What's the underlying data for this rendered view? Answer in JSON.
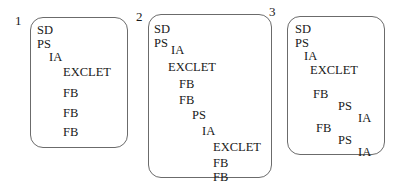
{
  "figure": {
    "type": "sequence-cascade-diagram",
    "panel_count": 3,
    "token_vocabulary": [
      "SD",
      "PS",
      "IA",
      "EXCLET",
      "FB"
    ],
    "background_color": "#ffffff",
    "border_color": "#6b6b6b",
    "text_color": "#191919"
  },
  "panels": [
    {
      "number": "1",
      "number_x": 15,
      "number_y": 14,
      "box": {
        "x": 30,
        "y": 17,
        "w": 98,
        "h": 131
      },
      "tokens": [
        {
          "label": "SD",
          "x": 6,
          "y": 6
        },
        {
          "label": "PS",
          "x": 6,
          "y": 20
        },
        {
          "label": "IA",
          "x": 18,
          "y": 33
        },
        {
          "label": "EXCLET",
          "x": 32,
          "y": 48
        },
        {
          "label": "FB",
          "x": 32,
          "y": 69
        },
        {
          "label": "FB",
          "x": 32,
          "y": 89
        },
        {
          "label": "FB",
          "x": 32,
          "y": 108
        }
      ]
    },
    {
      "number": "2",
      "number_x": 136,
      "number_y": 10,
      "box": {
        "x": 148,
        "y": 14,
        "w": 124,
        "h": 164
      },
      "tokens": [
        {
          "label": "SD",
          "x": 5,
          "y": 8
        },
        {
          "label": "PS",
          "x": 5,
          "y": 22
        },
        {
          "label": "IA",
          "x": 22,
          "y": 29
        },
        {
          "label": "EXCLET",
          "x": 19,
          "y": 46
        },
        {
          "label": "FB",
          "x": 30,
          "y": 63
        },
        {
          "label": "FB",
          "x": 30,
          "y": 79
        },
        {
          "label": "PS",
          "x": 43,
          "y": 94
        },
        {
          "label": "IA",
          "x": 53,
          "y": 110
        },
        {
          "label": "EXCLET",
          "x": 64,
          "y": 126
        },
        {
          "label": "FB",
          "x": 64,
          "y": 142
        },
        {
          "label": "FB",
          "x": 64,
          "y": 156
        }
      ]
    },
    {
      "number": "3",
      "number_x": 269,
      "number_y": 5,
      "box": {
        "x": 287,
        "y": 16,
        "w": 98,
        "h": 139
      },
      "tokens": [
        {
          "label": "SD",
          "x": 7,
          "y": 6
        },
        {
          "label": "PS",
          "x": 7,
          "y": 20
        },
        {
          "label": "IA",
          "x": 16,
          "y": 33
        },
        {
          "label": "EXCLET",
          "x": 22,
          "y": 47
        },
        {
          "label": "FB",
          "x": 25,
          "y": 71
        },
        {
          "label": "PS",
          "x": 50,
          "y": 83
        },
        {
          "label": "IA",
          "x": 70,
          "y": 95
        },
        {
          "label": "FB",
          "x": 28,
          "y": 105
        },
        {
          "label": "PS",
          "x": 50,
          "y": 117
        },
        {
          "label": "IA",
          "x": 70,
          "y": 129
        }
      ]
    }
  ]
}
